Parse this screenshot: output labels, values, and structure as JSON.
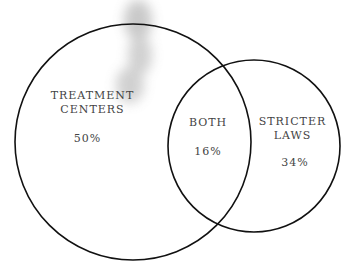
{
  "diagram": {
    "type": "venn",
    "regions": [
      {
        "id": "treatment",
        "label_line1": "TREATMENT",
        "label_line2": "CENTERS",
        "value": "50%"
      },
      {
        "id": "both",
        "label": "BOTH",
        "value": "16%"
      },
      {
        "id": "laws",
        "label_line1": "STRICTER",
        "label_line2": "LAWS",
        "value": "34%"
      }
    ],
    "colors": {
      "stroke": "#111111",
      "text": "#444444",
      "smudge": "#9a9a9a"
    }
  }
}
